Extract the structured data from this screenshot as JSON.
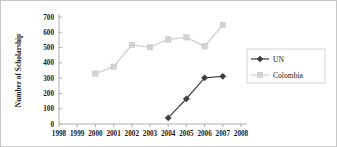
{
  "chart_data": {
    "type": "line",
    "title": "",
    "xlabel": "",
    "ylabel": "Number of Scholarship",
    "x": [
      1998,
      1999,
      2000,
      2001,
      2002,
      2003,
      2004,
      2005,
      2006,
      2007,
      2008
    ],
    "xtick_labels": [
      "1998",
      "1999",
      "2000",
      "2001",
      "2002",
      "2003",
      "2004",
      "2005",
      "2006",
      "2007",
      "2008"
    ],
    "ytick_labels": [
      "0",
      "100",
      "200",
      "300",
      "400",
      "500",
      "600",
      "700"
    ],
    "yticks": [
      0,
      100,
      200,
      300,
      400,
      500,
      600,
      700
    ],
    "ylim": [
      0,
      700
    ],
    "xlim": [
      1998,
      2008
    ],
    "grid": false,
    "legend_position": "right",
    "series": [
      {
        "name": "UN",
        "color": "#4a4a4a",
        "marker": "diamond",
        "x": [
          2004,
          2005,
          2006,
          2007
        ],
        "values": [
          40,
          165,
          302,
          312
        ]
      },
      {
        "name": "Colombia",
        "color": "#d2d2d2",
        "marker": "square",
        "x": [
          2000,
          2001,
          2002,
          2003,
          2004,
          2005,
          2006,
          2007
        ],
        "values": [
          330,
          375,
          518,
          503,
          553,
          567,
          508,
          648
        ]
      }
    ]
  },
  "legend": {
    "entries": [
      {
        "label": "UN"
      },
      {
        "label": "Colombia"
      }
    ]
  }
}
